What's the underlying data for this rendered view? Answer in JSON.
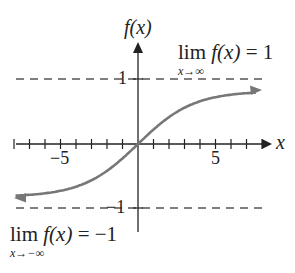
{
  "chart_data": {
    "type": "line",
    "title": "",
    "xlabel": "x",
    "ylabel": "f(x)",
    "xlim": [
      -8.5,
      9.5
    ],
    "ylim": [
      -1.4,
      1.5
    ],
    "x_ticks": [
      -8,
      -7,
      -6,
      -5,
      -4,
      -3,
      -2,
      -1,
      0,
      1,
      2,
      3,
      4,
      5,
      6,
      7,
      8
    ],
    "x_tick_labels": {
      "-5": "−5",
      "5": "5"
    },
    "y_tick_labels": {
      "1": "1",
      "-1": "−1"
    },
    "asymptotes": [
      {
        "y": 1,
        "style": "dashed"
      },
      {
        "y": -1,
        "style": "dashed"
      }
    ],
    "series": [
      {
        "name": "f(x)",
        "x": [
          -8,
          -6,
          -4,
          -3,
          -2,
          -1,
          0,
          1,
          2,
          3,
          4,
          6,
          8
        ],
        "y": [
          -0.8,
          -0.74,
          -0.62,
          -0.52,
          -0.4,
          -0.24,
          0,
          0.24,
          0.4,
          0.52,
          0.62,
          0.74,
          0.8
        ],
        "color": "#777777"
      }
    ],
    "annotations": [
      {
        "text": "lim f(x) = 1",
        "subscript": "x→∞"
      },
      {
        "text": "lim f(x) = −1",
        "subscript": "x→−∞"
      }
    ],
    "grid": false
  },
  "labels": {
    "y_axis": "f(x)",
    "x_axis": "x",
    "tick_neg5": "−5",
    "tick_5": "5",
    "y_tick_1": "1",
    "y_tick_neg1": "−1",
    "lim_top_main": "lim",
    "lim_top_fx": "f(x)",
    "lim_top_eq": "= 1",
    "lim_top_sub": "x→∞",
    "lim_bot_main": "lim",
    "lim_bot_fx": "f(x)",
    "lim_bot_eq": "= −1",
    "lim_bot_sub": "x→−∞"
  }
}
